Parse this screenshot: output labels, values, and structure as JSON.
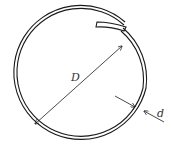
{
  "diagram": {
    "labels": {
      "diameter": "D",
      "wire_thickness": "d"
    },
    "colors": {
      "line": "#1a1a1a",
      "text": "#333333",
      "background": "#ffffff"
    }
  }
}
